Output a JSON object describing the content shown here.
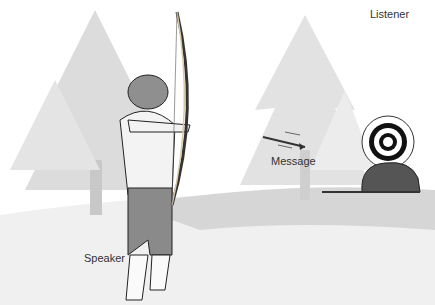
{
  "labels": {
    "speaker": "Speaker",
    "message": "Message",
    "listener": "Listener"
  },
  "colors": {
    "tree": "#d9d9d9",
    "ground": "#cfcfcf",
    "figure": "#8a8a8a",
    "outline": "#222222",
    "rock": "#555555"
  }
}
